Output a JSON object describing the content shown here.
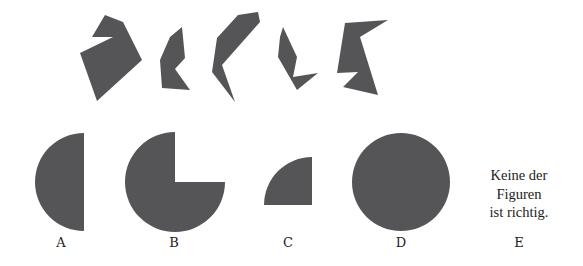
{
  "colors": {
    "shape_fill": "#555557",
    "background": "#ffffff",
    "text": "#222222"
  },
  "pieces": [
    {
      "id": "piece-1",
      "points": "105,15 123,22 142,60 97,101 80,53 113,37 92,37"
    },
    {
      "id": "piece-2",
      "points": "182,27 185,58 175,69 190,90 162,88 160,60 170,37"
    },
    {
      "id": "piece-3",
      "points": "258,12 260,22 222,65 235,102 212,72 217,38 238,15"
    },
    {
      "id": "piece-4",
      "points": "283,27 297,57 293,77 318,73 297,90 278,57 280,37"
    },
    {
      "id": "piece-5",
      "points": "345,23 388,20 360,37 378,95 343,87 358,72 337,73"
    }
  ],
  "options": [
    {
      "letter": "A",
      "shape": "semicircle-left",
      "x": 61
    },
    {
      "letter": "B",
      "shape": "three-quarter-circle",
      "x": 174
    },
    {
      "letter": "C",
      "shape": "quarter-circle",
      "x": 288
    },
    {
      "letter": "D",
      "shape": "full-circle",
      "x": 401
    },
    {
      "letter": "E",
      "shape": "text",
      "x": 519
    }
  ],
  "option_e_text": {
    "line1": "Keine der",
    "line2": "Figuren",
    "line3": "ist richtig."
  }
}
